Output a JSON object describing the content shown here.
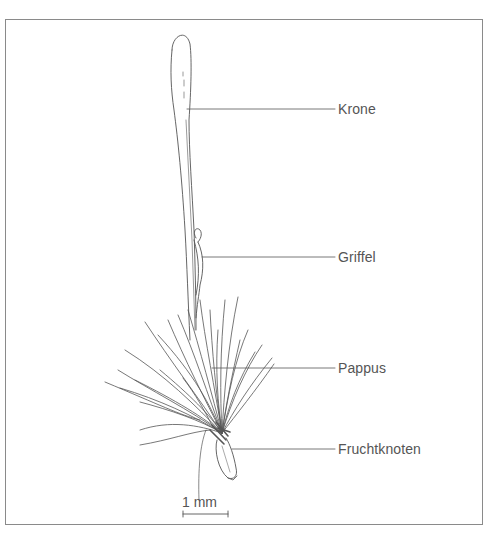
{
  "figure": {
    "labels": [
      {
        "id": "krone",
        "text": "Krone"
      },
      {
        "id": "griffel",
        "text": "Griffel"
      },
      {
        "id": "pappus",
        "text": "Pappus"
      },
      {
        "id": "fruchtknoten",
        "text": "Fruchtknoten"
      }
    ],
    "scale_bar": {
      "label": "1 mm"
    },
    "colors": {
      "line": "#555555",
      "frame": "#8a8a8a",
      "background": "#ffffff"
    }
  }
}
